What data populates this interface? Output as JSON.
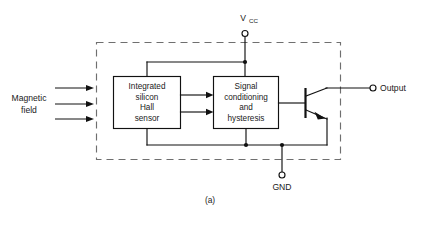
{
  "figure": {
    "caption": "(a)",
    "title_absent": true
  },
  "labels": {
    "vcc": "V",
    "vcc_subscript": "CC",
    "gnd": "GND",
    "output": "Output",
    "magnetic_line1": "Magnetic",
    "magnetic_line2": "field"
  },
  "blocks": [
    {
      "id": "hall-sensor",
      "lines": [
        "Integrated",
        "silicon",
        "Hall",
        "sensor"
      ]
    },
    {
      "id": "signal-conditioning",
      "lines": [
        "Signal",
        "conditioning",
        "and",
        "hysteresis"
      ]
    }
  ],
  "colors": {
    "line": "#111111",
    "dashed_package": "#6f6f6f",
    "text": "#1a1a1a",
    "background": "#ffffff"
  }
}
